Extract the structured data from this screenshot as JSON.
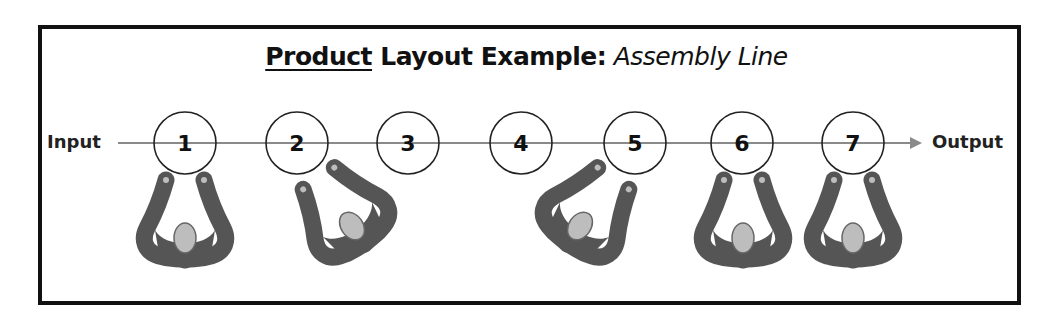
{
  "title": {
    "underlined_part": "Product",
    "bold_part": " Layout Example:",
    "italic_part": " Assembly Line"
  },
  "line": {
    "input_label": "Input",
    "output_label": "Output"
  },
  "stations": [
    {
      "number": "1",
      "cx": 185
    },
    {
      "number": "2",
      "cx": 297
    },
    {
      "number": "3",
      "cx": 408
    },
    {
      "number": "4",
      "cx": 521
    },
    {
      "number": "5",
      "cx": 635
    },
    {
      "number": "6",
      "cx": 742
    },
    {
      "number": "7",
      "cx": 853
    }
  ],
  "workers": [
    {
      "label": "worker-at-station-1",
      "cx": 185,
      "rotation_deg": 0
    },
    {
      "label": "worker-between-stations-2-3",
      "cx": 358,
      "rotation_deg": -35
    },
    {
      "label": "worker-between-stations-4-5",
      "cx": 575,
      "rotation_deg": 35
    },
    {
      "label": "worker-at-station-6",
      "cx": 743,
      "rotation_deg": 0
    },
    {
      "label": "worker-at-station-7",
      "cx": 853,
      "rotation_deg": 0
    }
  ],
  "colors": {
    "frame": "#111111",
    "line": "#8a8a8a",
    "worker_body": "#555555",
    "worker_head": "#bdbdbd"
  }
}
